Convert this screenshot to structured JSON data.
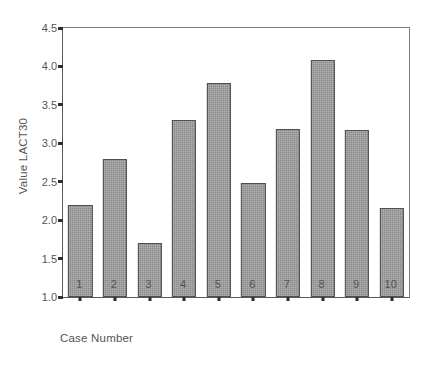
{
  "chart_data": {
    "type": "bar",
    "title": "",
    "xlabel": "Case Number",
    "ylabel": "Value LACT30",
    "categories": [
      "1",
      "2",
      "3",
      "4",
      "5",
      "6",
      "7",
      "8",
      "9",
      "10"
    ],
    "values": [
      2.2,
      2.8,
      1.7,
      3.3,
      3.78,
      2.48,
      3.18,
      4.08,
      3.17,
      2.16
    ],
    "ylim": [
      1.0,
      4.5
    ],
    "yticks": [
      "4.5",
      "4.0",
      "3.5",
      "3.0",
      "2.5",
      "2.0",
      "1.5",
      "1.0"
    ],
    "ytick_values": [
      4.5,
      4.0,
      3.5,
      3.0,
      2.5,
      2.0,
      1.5,
      1.0
    ],
    "grid": false,
    "legend": false,
    "bar_color": "#8a8a8a",
    "bar_edge_color": "#4f4f4f",
    "axis_color": "#5a5a5a",
    "background": "#ffffff"
  }
}
